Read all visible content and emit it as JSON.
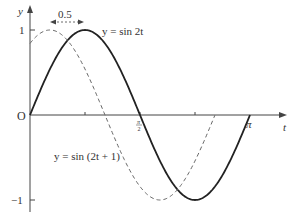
{
  "chart_data": {
    "type": "line",
    "title": "",
    "xlabel": "t",
    "ylabel": "y",
    "xlim": [
      0,
      3.3
    ],
    "ylim": [
      -1.05,
      1.1
    ],
    "x_ticks": [
      {
        "value": 1.5708,
        "label": "π/2"
      },
      {
        "value": 3.1416,
        "label": "π"
      }
    ],
    "y_ticks": [
      {
        "value": 1,
        "label": "1"
      },
      {
        "value": -1,
        "label": "−1"
      }
    ],
    "origin_label": "O",
    "series": [
      {
        "name": "y = sin 2t",
        "style": "solid",
        "function": "sin(2t)",
        "t_range": [
          0,
          3.1416
        ]
      },
      {
        "name": "y = sin (2t + 1)",
        "style": "dashed",
        "function": "sin(2t+1)",
        "t_range": [
          0,
          2.64
        ]
      }
    ],
    "annotations": [
      {
        "text": "0.5",
        "type": "double-arrow",
        "from_t": 0.285,
        "to_t": 0.785,
        "y": 1.0
      }
    ],
    "grid": false
  },
  "labels": {
    "y_axis": "y",
    "t_axis": "t",
    "origin": "O",
    "one": "1",
    "minus_one": "−1",
    "pi": "π",
    "half_pi_num": "π",
    "half_pi_den": "2",
    "shift": "0.5",
    "solid_curve": "y = sin 2t",
    "dashed_curve": "y = sin (2t + 1)"
  }
}
